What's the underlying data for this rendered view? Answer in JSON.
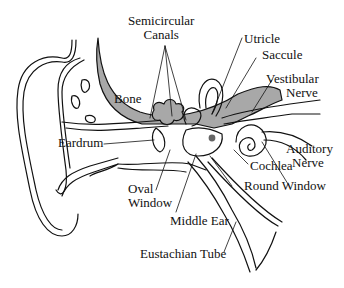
{
  "diagram": {
    "colors": {
      "bone": "#a8a8a8",
      "line": "#111111",
      "background": "#ffffff",
      "dot": "#666666"
    },
    "labels": {
      "semicircular_1": "Semicircular",
      "semicircular_2": "Canals",
      "utricle": "Utricle",
      "saccule": "Saccule",
      "vestibular_1": "Vestibular",
      "vestibular_2": "Nerve",
      "bone": "Bone",
      "eardrum": "Eardrum",
      "auditory_1": "Auditory",
      "auditory_2": "Nerve",
      "cochlea": "Cochlea",
      "oval_1": "Oval",
      "oval_2": "Window",
      "round_window": "Round Window",
      "middle_ear": "Middle Ear",
      "eustachian": "Eustachian Tube"
    }
  }
}
